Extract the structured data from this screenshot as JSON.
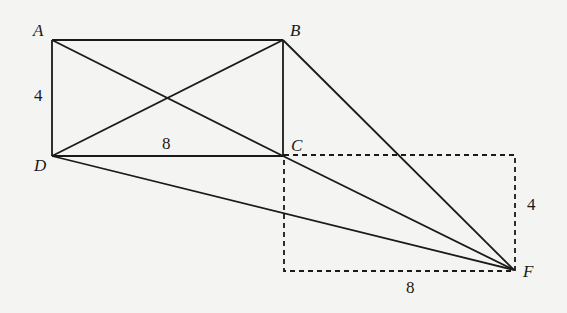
{
  "diagram": {
    "points": {
      "A": {
        "label": "A",
        "x": 52,
        "y": 40
      },
      "B": {
        "label": "B",
        "x": 283,
        "y": 40
      },
      "C": {
        "label": "C",
        "x": 283,
        "y": 156
      },
      "D": {
        "label": "D",
        "x": 52,
        "y": 156
      },
      "F": {
        "label": "F",
        "x": 514,
        "y": 270
      }
    },
    "measurements": {
      "AD": "4",
      "DC": "8",
      "dashed_height": "4",
      "dashed_width": "8"
    },
    "segments": [
      "AB",
      "BC",
      "CD",
      "DA",
      "AC",
      "BD",
      "BF",
      "CF",
      "DF"
    ],
    "dashed_rectangle": {
      "from": "C",
      "to": "F"
    },
    "colors": {
      "line": "#1a1a1a",
      "background": "#f4f4f2"
    }
  }
}
